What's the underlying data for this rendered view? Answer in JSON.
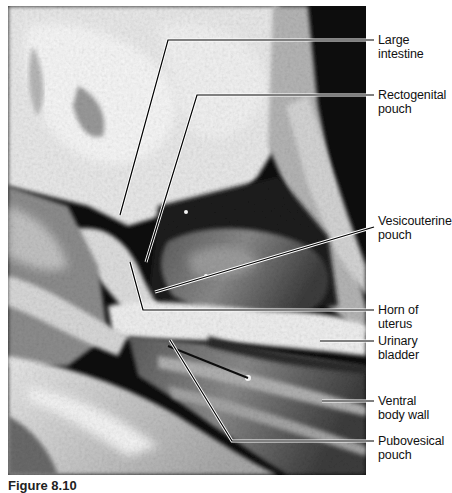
{
  "figure": {
    "image_alt": "Dissection photograph of pelvic region showing peritoneal pouches",
    "image_style": "grayscale",
    "leader_line_color": "#000000",
    "leader_line_halo": "#ffffff",
    "label_color": "#111111"
  },
  "labels": [
    {
      "id": "large-intestine",
      "text": "Large\nintestine",
      "top": 33
    },
    {
      "id": "rectogenital-pouch",
      "text": "Rectogenital\npouch",
      "top": 88
    },
    {
      "id": "vesicouterine-pouch",
      "text": "Vesicouterine\npouch",
      "top": 214
    },
    {
      "id": "horn-of-uterus",
      "text": "Horn of\nuterus",
      "top": 303
    },
    {
      "id": "urinary-bladder",
      "text": "Urinary\nbladder",
      "top": 334
    },
    {
      "id": "ventral-body-wall",
      "text": "Ventral\nbody wall",
      "top": 394
    },
    {
      "id": "pubovesical-pouch",
      "text": "Pubovesical\npouch",
      "top": 434
    }
  ],
  "caption": {
    "text": "Figure 8.10"
  }
}
